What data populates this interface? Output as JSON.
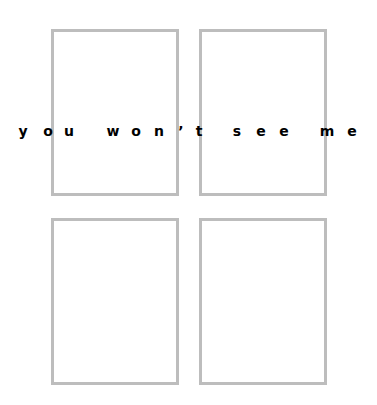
{
  "caption": {
    "text": "you won't see me",
    "letters": [
      {
        "ch": "y",
        "x": 23
      },
      {
        "ch": "o",
        "x": 48
      },
      {
        "ch": "u",
        "x": 69
      },
      {
        "ch": "w",
        "x": 113
      },
      {
        "ch": "o",
        "x": 136
      },
      {
        "ch": "n",
        "x": 159
      },
      {
        "ch": "’",
        "x": 181
      },
      {
        "ch": "t",
        "x": 199
      },
      {
        "ch": "s",
        "x": 237
      },
      {
        "ch": "e",
        "x": 261
      },
      {
        "ch": "e",
        "x": 284
      },
      {
        "ch": "m",
        "x": 327
      },
      {
        "ch": "e",
        "x": 352
      }
    ]
  },
  "boxes": [
    {
      "name": "top-left",
      "x": 51,
      "y": 29,
      "w": 128,
      "h": 167
    },
    {
      "name": "top-right",
      "x": 199,
      "y": 29,
      "w": 128,
      "h": 167
    },
    {
      "name": "bottom-left",
      "x": 51,
      "y": 218,
      "w": 128,
      "h": 167
    },
    {
      "name": "bottom-right",
      "x": 199,
      "y": 218,
      "w": 128,
      "h": 167
    }
  ],
  "colors": {
    "border": "#bdbdbd",
    "text": "#000000",
    "background": "#ffffff"
  }
}
